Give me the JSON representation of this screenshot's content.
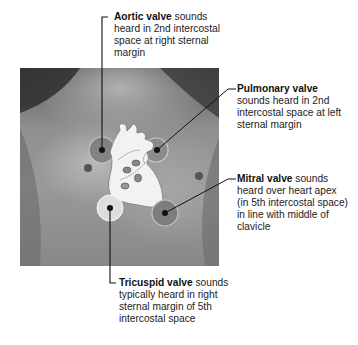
{
  "figure": {
    "labels": {
      "aortic": {
        "name": "Aortic valve",
        "text_lines": [
          " sounds",
          "heard in 2nd intercostal",
          "space at right sternal",
          "margin"
        ]
      },
      "pulmonary": {
        "name": "Pulmonary valve",
        "text_lines": [
          "",
          "sounds heard in 2nd",
          "intercostal space at left",
          "sternal margin"
        ]
      },
      "mitral": {
        "name": "Mitral valve",
        "text_lines": [
          " sounds",
          "heard over heart apex",
          "(in 5th intercostal space)",
          "in line with middle of",
          "clavicle"
        ]
      },
      "tricuspid": {
        "name": "Tricuspid valve",
        "text_lines": [
          " sounds",
          "typically heard in right",
          "sternal margin of 5th",
          "intercostal space"
        ]
      }
    },
    "colors": {
      "dark_circle": "#7a7a7a",
      "light_circle": "#d8d8d8",
      "heart_fill": "#f2f2f2",
      "line": "#111111"
    }
  }
}
